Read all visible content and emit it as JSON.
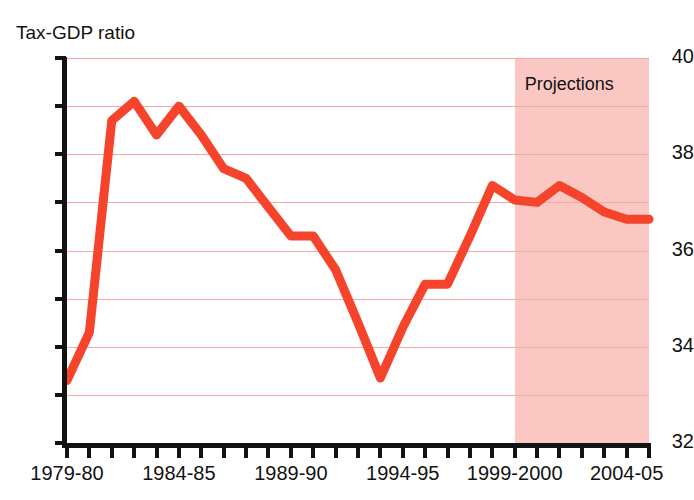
{
  "chart_data": {
    "type": "line",
    "title": "",
    "ylabel": "Tax-GDP ratio",
    "xlabel": "",
    "ylim": [
      32,
      40
    ],
    "y_ticks_major": [
      32,
      34,
      36,
      38,
      40
    ],
    "y_ticks_minor": [
      33,
      35,
      37,
      39
    ],
    "y_tick_labels": [
      "32",
      "34",
      "36",
      "38",
      "40"
    ],
    "gridlines": [
      33,
      34,
      35,
      36,
      37,
      38,
      39,
      40
    ],
    "grid": true,
    "legend": "none",
    "x": [
      "1979-80",
      "1980-81",
      "1981-82",
      "1982-83",
      "1983-84",
      "1984-85",
      "1985-86",
      "1986-87",
      "1987-88",
      "1988-89",
      "1989-90",
      "1990-91",
      "1991-92",
      "1992-93",
      "1993-94",
      "1994-95",
      "1995-96",
      "1996-97",
      "1997-98",
      "1998-99",
      "1999-2000",
      "2000-01",
      "2001-02",
      "2002-03",
      "2003-04",
      "2004-05",
      "2005-06"
    ],
    "x_tick_labels": [
      "1979-80",
      "1984-85",
      "1989-90",
      "1994-95",
      "1999-2000",
      "2004-05"
    ],
    "x_tick_label_indices": [
      0,
      5,
      10,
      15,
      20,
      25
    ],
    "values": [
      33.3,
      34.3,
      38.7,
      39.1,
      38.4,
      39.0,
      38.4,
      37.7,
      37.5,
      36.9,
      36.3,
      36.3,
      35.6,
      34.5,
      33.35,
      34.4,
      35.3,
      35.3,
      36.3,
      37.35,
      37.05,
      37.0,
      37.35,
      37.1,
      36.8,
      36.65,
      36.65
    ],
    "series_color": "#f6432b",
    "annotations": [
      {
        "name": "projections-band",
        "label": "Projections",
        "type": "shaded-region",
        "start_index": 20,
        "end_index": 26,
        "color": "#fbc4c0"
      }
    ]
  }
}
